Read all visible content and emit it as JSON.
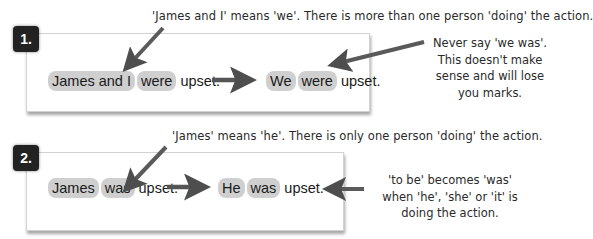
{
  "examples": [
    {
      "number": "1.",
      "top_note": "'James and I' means 'we'.  There is more than one person 'doing' the action.",
      "original": {
        "subject": "James and I",
        "verb": "were",
        "rest": "upset."
      },
      "corrected": {
        "subject": "We",
        "verb": "were",
        "rest": "upset."
      },
      "side_note": [
        "Never say 'we was'.",
        "This doesn't make",
        "sense and will lose",
        "you marks."
      ]
    },
    {
      "number": "2.",
      "top_note": "'James' means 'he'.  There is only one person 'doing' the action.",
      "original": {
        "subject": "James",
        "verb": "was",
        "rest": "upset."
      },
      "corrected": {
        "subject": "He",
        "verb": "was",
        "rest": "upset."
      },
      "side_note": [
        "'to be' becomes 'was'",
        "when 'he', 'she' or 'it' is",
        "doing the action."
      ]
    }
  ],
  "colors": {
    "highlight": "#cfcfcf",
    "badge": "#222222",
    "arrow": "#555555"
  }
}
